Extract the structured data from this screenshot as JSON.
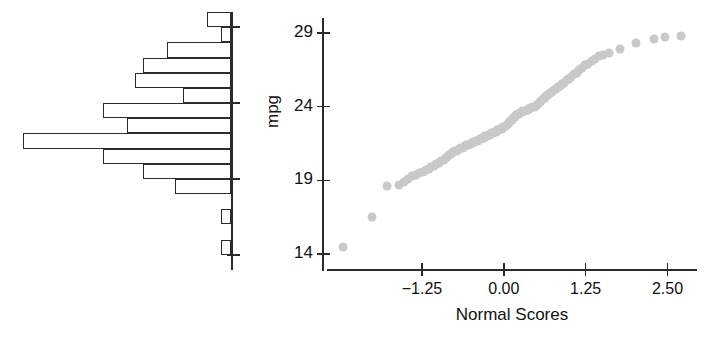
{
  "chart_data": [
    {
      "type": "bar",
      "orientation": "horizontal",
      "title": "",
      "xlabel": "",
      "ylabel": "",
      "note": "Horizontal histogram of mpg, bars extend leftward from a vertical axis; shares the mpg scale with the adjacent Q-Q plot.",
      "ylim": [
        13.0,
        30.0
      ],
      "grid": false,
      "tick_values": [
        29,
        24,
        19,
        14
      ],
      "bin_centers": [
        29.4,
        28.4,
        27.4,
        26.4,
        25.4,
        24.4,
        23.4,
        22.4,
        21.4,
        20.4,
        19.4,
        18.4,
        16.4,
        14.4
      ],
      "bin_low": [
        29.0,
        28.0,
        27.0,
        26.0,
        25.0,
        24.0,
        23.0,
        22.0,
        21.0,
        20.0,
        19.0,
        18.0,
        16.0,
        14.0
      ],
      "bin_high": [
        30.0,
        29.0,
        28.0,
        27.0,
        26.0,
        25.0,
        24.0,
        23.0,
        22.0,
        21.0,
        20.0,
        19.0,
        17.0,
        15.0
      ],
      "counts": [
        3,
        1,
        8,
        11,
        12,
        6,
        16,
        13,
        26,
        16,
        11,
        7,
        1,
        1
      ],
      "categories": [
        "29-30",
        "28-29",
        "27-28",
        "26-27",
        "25-26",
        "24-25",
        "23-24",
        "22-23",
        "21-22",
        "20-21",
        "19-20",
        "18-19",
        "16-17",
        "14-15"
      ],
      "values": [
        3,
        1,
        8,
        11,
        12,
        6,
        16,
        13,
        26,
        16,
        11,
        7,
        1,
        1
      ]
    },
    {
      "type": "scatter",
      "title": "",
      "xlabel": "Normal Scores",
      "ylabel": "mpg",
      "note": "Normal quantile-quantile plot of mpg versus normal scores.",
      "xlim": [
        -2.7,
        2.95
      ],
      "ylim": [
        13.0,
        30.0
      ],
      "grid": false,
      "xticks": [
        -1.25,
        0.0,
        1.25,
        2.5
      ],
      "xtick_labels": [
        "-1.25",
        "0.00",
        "1.25",
        "2.50"
      ],
      "yticks": [
        29,
        24,
        19,
        14
      ],
      "ytick_labels": [
        "29",
        "24",
        "19",
        "14"
      ],
      "point_color": "#c9c9c9",
      "x": [
        -2.46,
        -2.02,
        -1.78,
        -1.6,
        -1.52,
        -1.46,
        -1.4,
        -1.34,
        -1.29,
        -1.24,
        -1.19,
        -1.15,
        -1.11,
        -1.07,
        -1.03,
        -0.99,
        -0.96,
        -0.92,
        -0.89,
        -0.86,
        -0.83,
        -0.8,
        -0.77,
        -0.74,
        -0.71,
        -0.68,
        -0.65,
        -0.63,
        -0.6,
        -0.57,
        -0.55,
        -0.52,
        -0.5,
        -0.47,
        -0.45,
        -0.42,
        -0.4,
        -0.37,
        -0.35,
        -0.33,
        -0.3,
        -0.28,
        -0.26,
        -0.23,
        -0.21,
        -0.19,
        -0.17,
        -0.14,
        -0.12,
        -0.1,
        -0.08,
        -0.06,
        -0.03,
        -0.01,
        0.01,
        0.03,
        0.06,
        0.08,
        0.1,
        0.12,
        0.14,
        0.17,
        0.19,
        0.21,
        0.23,
        0.26,
        0.28,
        0.3,
        0.33,
        0.35,
        0.37,
        0.4,
        0.42,
        0.45,
        0.47,
        0.5,
        0.52,
        0.55,
        0.57,
        0.6,
        0.63,
        0.65,
        0.68,
        0.71,
        0.74,
        0.77,
        0.8,
        0.83,
        0.86,
        0.89,
        0.92,
        0.96,
        0.99,
        1.03,
        1.07,
        1.11,
        1.15,
        1.19,
        1.24,
        1.29,
        1.34,
        1.4,
        1.46,
        1.52,
        1.6,
        1.78,
        2.02,
        2.3,
        2.46,
        2.7
      ],
      "y": [
        14.5,
        16.5,
        18.6,
        18.7,
        18.9,
        19.1,
        19.3,
        19.4,
        19.5,
        19.6,
        19.7,
        19.8,
        19.9,
        20.0,
        20.1,
        20.2,
        20.3,
        20.4,
        20.5,
        20.6,
        20.7,
        20.8,
        20.9,
        21.0,
        21.0,
        21.1,
        21.2,
        21.2,
        21.3,
        21.4,
        21.4,
        21.5,
        21.5,
        21.6,
        21.6,
        21.7,
        21.7,
        21.8,
        21.8,
        21.9,
        21.9,
        22.0,
        22.0,
        22.1,
        22.1,
        22.2,
        22.2,
        22.3,
        22.3,
        22.4,
        22.4,
        22.5,
        22.5,
        22.6,
        22.6,
        22.7,
        22.8,
        22.9,
        23.0,
        23.1,
        23.2,
        23.3,
        23.4,
        23.5,
        23.5,
        23.6,
        23.6,
        23.7,
        23.7,
        23.8,
        23.8,
        23.9,
        23.9,
        24.0,
        24.0,
        24.1,
        24.2,
        24.3,
        24.4,
        24.5,
        24.6,
        24.7,
        24.8,
        24.9,
        25.0,
        25.1,
        25.2,
        25.3,
        25.4,
        25.5,
        25.6,
        25.8,
        25.9,
        26.0,
        26.2,
        26.3,
        26.5,
        26.6,
        26.8,
        26.9,
        27.1,
        27.2,
        27.4,
        27.5,
        27.6,
        27.9,
        28.3,
        28.6,
        28.7,
        28.8
      ]
    }
  ],
  "histogram": {
    "tick_labels": [
      "29",
      "24",
      "19",
      "14"
    ]
  },
  "qq_plot": {
    "y_axis_title": "mpg",
    "x_axis_title": "Normal Scores",
    "y_tick_labels": [
      "29",
      "24",
      "19",
      "14"
    ],
    "x_tick_labels": [
      "-1.25",
      "0.00",
      "1.25",
      "2.50"
    ]
  }
}
